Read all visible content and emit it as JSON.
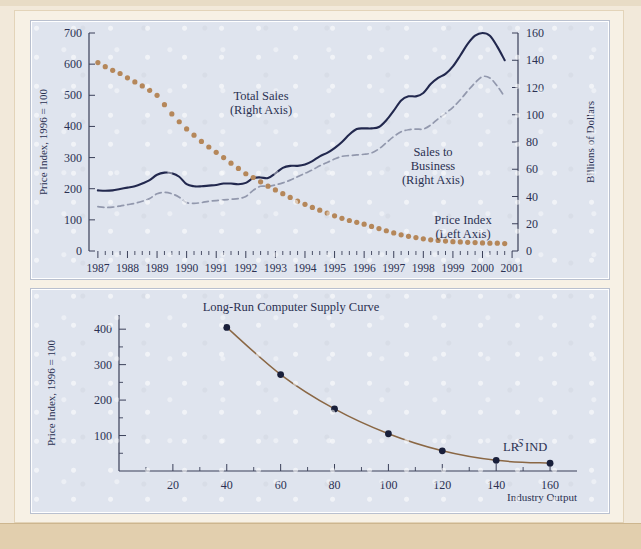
{
  "figure": {
    "background_color": "#dfe4ee",
    "frame_color": "#e2cfae"
  },
  "chart_data": [
    {
      "id": "computer-prices-and-sales",
      "type": "line",
      "title": "",
      "xlabel": "",
      "x": [
        1987,
        1987.25,
        1987.5,
        1987.75,
        1988,
        1988.25,
        1988.5,
        1988.75,
        1989,
        1989.25,
        1989.5,
        1989.75,
        1990,
        1990.25,
        1990.5,
        1990.75,
        1991,
        1991.25,
        1991.5,
        1991.75,
        1992,
        1992.25,
        1992.5,
        1992.75,
        1993,
        1993.25,
        1993.5,
        1993.75,
        1994,
        1994.25,
        1994.5,
        1994.75,
        1995,
        1995.25,
        1995.5,
        1995.75,
        1996,
        1996.25,
        1996.5,
        1996.75,
        1997,
        1997.25,
        1997.5,
        1997.75,
        1998,
        1998.25,
        1998.5,
        1998.75,
        1999,
        1999.25,
        1999.5,
        1999.75,
        2000,
        2000.25,
        2000.5,
        2000.75
      ],
      "xtick_labels": [
        "1987",
        "1988",
        "1989",
        "1990",
        "1991",
        "1992",
        "1993",
        "1994",
        "1995",
        "1996",
        "1997",
        "1998",
        "1999",
        "2000",
        "2001"
      ],
      "xlim": [
        1986.7,
        2001.2
      ],
      "minor_ticks_per_year": 4,
      "grid": false,
      "legend_position": "inline-annotations",
      "left_axis": {
        "label": "Price Index, 1996 = 100",
        "ticks": [
          0,
          100,
          200,
          300,
          400,
          500,
          600,
          700
        ],
        "ylim": [
          0,
          700
        ]
      },
      "right_axis": {
        "label": "Billions of Dollars",
        "ticks": [
          0,
          20,
          40,
          60,
          80,
          100,
          120,
          140,
          160
        ],
        "ylim": [
          0,
          160
        ]
      },
      "series": [
        {
          "name": "Price Index",
          "annotation": "Price Index\n(Left Axis)",
          "annotation_line1": "Price Index",
          "annotation_line2": "(Left Axis)",
          "axis": "left",
          "style": "dotted",
          "color": "#b5875a",
          "values": [
            605,
            592,
            580,
            570,
            556,
            543,
            530,
            516,
            500,
            470,
            440,
            415,
            392,
            372,
            352,
            334,
            317,
            300,
            282,
            265,
            248,
            236,
            222,
            208,
            196,
            184,
            172,
            160,
            150,
            140,
            131,
            122,
            113,
            105,
            98,
            92,
            86,
            79,
            72,
            65,
            58,
            52,
            47,
            43,
            39,
            36,
            34,
            32,
            30,
            29,
            28,
            27,
            26,
            25,
            25,
            24
          ]
        },
        {
          "name": "Total Sales",
          "annotation_line1": "Total Sales",
          "annotation_line2": "(Right Axis)",
          "axis": "right",
          "style": "solid",
          "color": "#22284e",
          "values": [
            44.5,
            44.2,
            44.5,
            45.5,
            46.5,
            47.5,
            49.5,
            52.0,
            56.0,
            57.5,
            57.0,
            54.5,
            49.0,
            47.5,
            47.5,
            48.0,
            48.5,
            49.5,
            49.5,
            49.0,
            50.0,
            53.5,
            54.0,
            53.5,
            57.0,
            61.0,
            62.5,
            62.5,
            63.5,
            66.0,
            69.5,
            72.0,
            75.5,
            80.0,
            85.5,
            89.5,
            90.0,
            90.0,
            91.0,
            96.0,
            103.0,
            110.5,
            113.5,
            113.5,
            116.0,
            122.5,
            127.0,
            130.0,
            135.5,
            143.5,
            152.0,
            158.0,
            160.0,
            158.0,
            150.0,
            140.0
          ]
        },
        {
          "name": "Sales to Business",
          "annotation_line1": "Sales to",
          "annotation_line2": "Business",
          "annotation_line3": "(Right Axis)",
          "axis": "right",
          "style": "dashed",
          "color": "#9298ad",
          "values": [
            32.5,
            32.0,
            32.2,
            33.0,
            34.0,
            35.0,
            36.5,
            38.5,
            42.0,
            43.0,
            42.0,
            39.5,
            35.5,
            35.0,
            35.5,
            36.5,
            37.0,
            37.5,
            38.0,
            38.5,
            40.0,
            44.5,
            47.5,
            47.5,
            48.5,
            50.0,
            52.0,
            54.5,
            57.0,
            59.5,
            62.5,
            65.0,
            67.5,
            69.5,
            70.0,
            70.5,
            71.0,
            72.0,
            75.0,
            79.5,
            84.0,
            87.5,
            89.0,
            89.5,
            89.5,
            92.5,
            97.0,
            101.0,
            105.5,
            111.0,
            117.5,
            123.5,
            128.0,
            127.0,
            121.0,
            113.0
          ]
        }
      ]
    },
    {
      "id": "long-run-computer-supply-curve",
      "type": "line",
      "title": "Long-Run Computer Supply Curve",
      "xlabel": "Industry Output",
      "ylabel": "Price Index, 1996 = 100",
      "xlim": [
        0,
        170
      ],
      "ylim": [
        0,
        440
      ],
      "xtick_labels": [
        "20",
        "40",
        "60",
        "80",
        "100",
        "120",
        "140",
        "160"
      ],
      "xticks": [
        20,
        40,
        60,
        80,
        100,
        120,
        140,
        160
      ],
      "x_minor_step": 10,
      "yticks": [
        100,
        200,
        300,
        400
      ],
      "y_minor_step": 50,
      "grid": false,
      "curve_color": "#8a6744",
      "marker_color": "#191f3a",
      "curve_label_prefix": "LR",
      "curve_label_main": "S",
      "curve_label_sub": "IND",
      "x": [
        40,
        60,
        80,
        100,
        120,
        140,
        160
      ],
      "values": [
        405,
        272,
        175,
        105,
        57,
        30,
        22
      ]
    }
  ]
}
